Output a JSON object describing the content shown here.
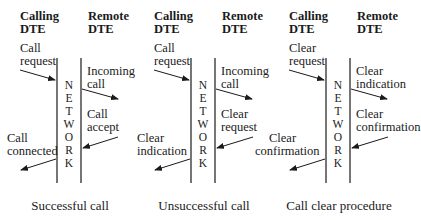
{
  "diagram": {
    "headers": {
      "calling": [
        "Calling",
        "DTE"
      ],
      "remote": [
        "Remote",
        "DTE"
      ]
    },
    "network_letters": [
      "N",
      "E",
      "T",
      "W",
      "O",
      "R",
      "K"
    ],
    "panels": [
      {
        "caption": "Successful call",
        "labels": {
          "tl": [
            "Call",
            "request"
          ],
          "tr": [
            "Incoming",
            "call"
          ],
          "br": [
            "Call",
            "accept"
          ],
          "bl": [
            "Call",
            "connected"
          ]
        }
      },
      {
        "caption": "Unsuccessful call",
        "labels": {
          "tl": [
            "Call",
            "request"
          ],
          "tr": [
            "Incoming",
            "call"
          ],
          "br": [
            "Clear",
            "request"
          ],
          "bl": [
            "Clear",
            "indication"
          ]
        }
      },
      {
        "caption": "Call clear procedure",
        "labels": {
          "tl": [
            "Clear",
            "request"
          ],
          "tr": [
            "Clear",
            "indication"
          ],
          "br": [
            "Clear",
            "confirmation"
          ],
          "bl": [
            "Clear",
            "confirmation"
          ]
        }
      }
    ]
  }
}
